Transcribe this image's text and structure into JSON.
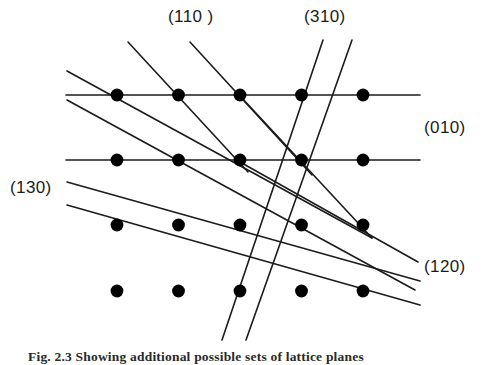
{
  "figure": {
    "background_color": "#ffffff",
    "line_color": "#1b1b1b",
    "dot_color": "#000000",
    "dot_radius": 6.4,
    "line_width": 1.6
  },
  "labels": {
    "plane_110": "(110 )",
    "plane_310": "(310)",
    "plane_010": "(010)",
    "plane_130": "(130)",
    "plane_120": "(120)"
  },
  "caption": {
    "text": "Fig. 2.3  Showing additional possible sets of lattice planes"
  },
  "chart_data": {
    "type": "scatter",
    "xlabel": "",
    "ylabel": "",
    "grid": false,
    "legend": "none",
    "lattice": {
      "columns_x": [
        117,
        178.5,
        240,
        301.5,
        363
      ],
      "rows_y": [
        95,
        160,
        225,
        291
      ],
      "column_spacing": 61.5,
      "row_spacing": 65.3,
      "point_count": 20
    },
    "points": [
      {
        "col": 0,
        "row": 0,
        "x": 117,
        "y": 95
      },
      {
        "col": 1,
        "row": 0,
        "x": 178.5,
        "y": 95
      },
      {
        "col": 2,
        "row": 0,
        "x": 240,
        "y": 95
      },
      {
        "col": 3,
        "row": 0,
        "x": 301.5,
        "y": 95
      },
      {
        "col": 4,
        "row": 0,
        "x": 363,
        "y": 95
      },
      {
        "col": 0,
        "row": 1,
        "x": 117,
        "y": 160
      },
      {
        "col": 1,
        "row": 1,
        "x": 178.5,
        "y": 160
      },
      {
        "col": 2,
        "row": 1,
        "x": 240,
        "y": 160
      },
      {
        "col": 3,
        "row": 1,
        "x": 301.5,
        "y": 160
      },
      {
        "col": 4,
        "row": 1,
        "x": 363,
        "y": 160
      },
      {
        "col": 0,
        "row": 2,
        "x": 117,
        "y": 225
      },
      {
        "col": 1,
        "row": 2,
        "x": 178.5,
        "y": 225
      },
      {
        "col": 2,
        "row": 2,
        "x": 240,
        "y": 225
      },
      {
        "col": 3,
        "row": 2,
        "x": 301.5,
        "y": 225
      },
      {
        "col": 4,
        "row": 2,
        "x": 363,
        "y": 225
      },
      {
        "col": 0,
        "row": 3,
        "x": 117,
        "y": 291
      },
      {
        "col": 1,
        "row": 3,
        "x": 178.5,
        "y": 291
      },
      {
        "col": 2,
        "row": 3,
        "x": 240,
        "y": 291
      },
      {
        "col": 3,
        "row": 3,
        "x": 301.5,
        "y": 291
      },
      {
        "col": 4,
        "row": 3,
        "x": 363,
        "y": 291
      }
    ],
    "plane_families": [
      {
        "index": "(010)",
        "description": "horizontal lines through rows 0 and 1",
        "count": 2,
        "lines": [
          {
            "x1": 66,
            "y1": 95,
            "x2": 420,
            "y2": 95
          },
          {
            "x1": 66,
            "y1": 160,
            "x2": 420,
            "y2": 160
          }
        ]
      },
      {
        "index": "(110 )",
        "description": "steep diagonals descending left-to-right",
        "count": 3,
        "lines": [
          {
            "x1": 128,
            "y1": 42,
            "x2": 248,
            "y2": 172
          },
          {
            "x1": 190,
            "y1": 42,
            "x2": 312,
            "y2": 175
          },
          {
            "x1": 241,
            "y1": 97,
            "x2": 372,
            "y2": 238
          }
        ]
      },
      {
        "index": "(310)",
        "description": "very steep diagonals descending right-to-left",
        "count": 2,
        "lines": [
          {
            "x1": 323,
            "y1": 40,
            "x2": 222,
            "y2": 340
          },
          {
            "x1": 352,
            "y1": 40,
            "x2": 246,
            "y2": 340
          }
        ]
      },
      {
        "index": "(120)",
        "description": "medium-slope diagonals descending left-to-right",
        "count": 3,
        "lines": [
          {
            "x1": 67,
            "y1": 71,
            "x2": 372,
            "y2": 238
          },
          {
            "x1": 67,
            "y1": 100,
            "x2": 415,
            "y2": 290
          },
          {
            "x1": 240,
            "y1": 162,
            "x2": 418,
            "y2": 262
          }
        ]
      },
      {
        "index": "(130)",
        "description": "shallow diagonals descending left-to-right",
        "count": 2,
        "lines": [
          {
            "x1": 67,
            "y1": 182,
            "x2": 420,
            "y2": 281
          },
          {
            "x1": 67,
            "y1": 205,
            "x2": 420,
            "y2": 305
          }
        ]
      }
    ]
  }
}
